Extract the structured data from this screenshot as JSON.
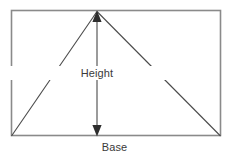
{
  "diagram": {
    "labels": {
      "height": "Height",
      "base": "Base"
    },
    "colors": {
      "frame_stroke": "#8a8a8a",
      "triangle_stroke": "#4a4a4a",
      "arrow_stroke": "#7a7a7a",
      "arrow_head_fill": "#2e2e2e",
      "text": "#3a3a3a",
      "background": "#ffffff"
    },
    "geometry": {
      "frame": {
        "x": 11,
        "y": 10,
        "width": 210,
        "height": 126
      },
      "triangle": {
        "apex": {
          "x": 97,
          "y": 11
        },
        "base_left": {
          "x": 11,
          "y": 136
        },
        "base_right": {
          "x": 221,
          "y": 136
        }
      },
      "height_arrow": {
        "x": 97,
        "y_top": 13,
        "y_bottom": 134,
        "double_headed": true
      }
    }
  }
}
